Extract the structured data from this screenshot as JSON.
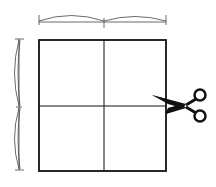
{
  "diagram": {
    "title": "Square folded into quarters with cut mark",
    "stroke_color": "#111111",
    "dimension_color": "#444444",
    "background": "#ffffff",
    "square": {
      "x": 38,
      "y": 39,
      "size": 128
    },
    "divisions": {
      "columns": 2,
      "rows": 2
    },
    "top_dimension": {
      "label": "equal halves (width)",
      "segments": 2
    },
    "left_dimension": {
      "label": "equal halves (height)",
      "segments": 2
    },
    "cut_marker": {
      "icon": "scissors-icon",
      "label": "cut along center line",
      "position": "right edge, horizontal midline"
    }
  }
}
